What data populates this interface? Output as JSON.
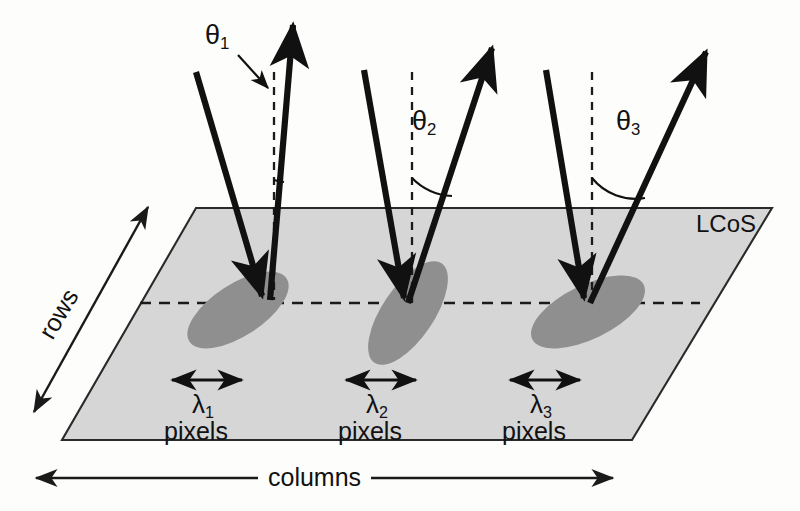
{
  "figure": {
    "name": "lcos-diffraction-diagram",
    "device_label": "LCoS",
    "axes": {
      "rows_label": "rows",
      "columns_label": "columns"
    },
    "colors": {
      "panel_fill": "#d6d6d6",
      "panel_stroke": "#1a1a1a",
      "spot_fill": "#8f8f8f",
      "beam_stroke": "#111111",
      "dashed_stroke": "#1a1a1a",
      "background": "#fdfdfb",
      "text": "#111111"
    },
    "beams": [
      {
        "id": "beam-1",
        "theta_symbol": "θ",
        "theta_subscript": "1",
        "theta_label": "θ1",
        "lambda_symbol": "λ",
        "lambda_subscript": "1",
        "lambda_label": "λ1",
        "pixels_label": "pixels",
        "angle_degrees": 8,
        "has_leader_arrow": true
      },
      {
        "id": "beam-2",
        "theta_symbol": "θ",
        "theta_subscript": "2",
        "theta_label": "θ2",
        "lambda_symbol": "λ",
        "lambda_subscript": "2",
        "lambda_label": "λ2",
        "pixels_label": "pixels",
        "angle_degrees": 26,
        "has_leader_arrow": false
      },
      {
        "id": "beam-3",
        "theta_symbol": "θ",
        "theta_subscript": "3",
        "theta_label": "θ3",
        "lambda_symbol": "λ",
        "lambda_subscript": "3",
        "lambda_label": "λ3",
        "pixels_label": "pixels",
        "angle_degrees": 38,
        "has_leader_arrow": false
      }
    ]
  }
}
